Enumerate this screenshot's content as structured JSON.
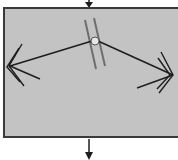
{
  "diagram": {
    "type": "reflection-schematic",
    "colors": {
      "background": "#ffffff",
      "panel_fill": "#c3c3c3",
      "panel_border": "#3a3a3a",
      "ray": "#1e1e1e",
      "mirror_lines": "#6e6e6e",
      "contact_point": "#e6e6e6"
    },
    "elements": {
      "input_arrow": "arrow pointing down into top of panel",
      "output_arrow": "arrow pointing down from bottom of panel",
      "double_lines": "two parallel slanted lines near top center",
      "contact_point": "small circle where rays meet",
      "left_ray": "ray from contact point to left multi-chevron arrowhead",
      "right_ray": "ray from contact point to right multi-chevron arrowhead"
    }
  }
}
